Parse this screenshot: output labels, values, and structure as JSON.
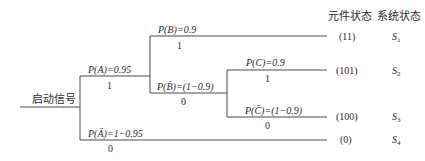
{
  "diagram": {
    "type": "event-tree",
    "headers": {
      "component_state": "元件状态",
      "system_state": "系统状态"
    },
    "root": {
      "label": "启动信号"
    },
    "branches": {
      "A": {
        "prob_label": "P(A)=0.95",
        "state": "1"
      },
      "A_bar": {
        "prob_label": "P(Ā)=1−0.95",
        "state": "0"
      },
      "B": {
        "prob_label": "P(B)=0.9",
        "state": "1"
      },
      "B_bar": {
        "prob_label": "P(B̄)=(1−0.9)",
        "state": "0"
      },
      "C": {
        "prob_label": "P(C)=0.9",
        "state": "1"
      },
      "C_bar": {
        "prob_label": "P(C̄)=(1−0.9)",
        "state": "0"
      }
    },
    "outcomes": [
      {
        "component_state": "(11)",
        "system_state": "S1",
        "sub": "1"
      },
      {
        "component_state": "(101)",
        "system_state": "S2",
        "sub": "2"
      },
      {
        "component_state": "(100)",
        "system_state": "S3",
        "sub": "3"
      },
      {
        "component_state": "(0)",
        "system_state": "S4",
        "sub": "4"
      }
    ]
  }
}
